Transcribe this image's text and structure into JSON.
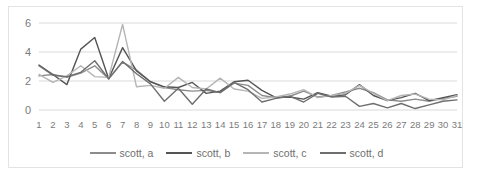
{
  "chart_data": {
    "type": "line",
    "title": "",
    "xlabel": "",
    "ylabel": "",
    "xlim": [
      1,
      31
    ],
    "ylim": [
      0,
      6
    ],
    "yticks": [
      0,
      2,
      4,
      6
    ],
    "grid": true,
    "legend_position": "bottom",
    "categories": [
      1,
      2,
      3,
      4,
      5,
      6,
      7,
      8,
      9,
      10,
      11,
      12,
      13,
      14,
      15,
      16,
      17,
      18,
      19,
      20,
      21,
      22,
      23,
      24,
      25,
      26,
      27,
      28,
      29,
      30,
      31
    ],
    "series": [
      {
        "name": "scott, a",
        "color": "#8c8c8c",
        "values": [
          2.35,
          2.45,
          2.25,
          2.55,
          3.05,
          2.15,
          3.3,
          2.75,
          1.95,
          1.55,
          1.4,
          1.3,
          1.35,
          1.2,
          1.85,
          1.7,
          1.0,
          0.85,
          0.95,
          1.3,
          0.9,
          1.0,
          1.25,
          1.5,
          1.2,
          0.7,
          0.6,
          0.75,
          0.6,
          0.8,
          0.95
        ]
      },
      {
        "name": "scott, b",
        "color": "#555555",
        "values": [
          3.1,
          2.45,
          1.75,
          4.2,
          5.0,
          2.15,
          4.3,
          2.7,
          1.95,
          1.6,
          1.55,
          1.9,
          1.15,
          1.3,
          1.95,
          2.05,
          1.35,
          0.85,
          0.9,
          0.75,
          1.2,
          0.95,
          1.05,
          1.75,
          1.0,
          0.65,
          0.85,
          1.15,
          0.65,
          0.85,
          1.05
        ]
      },
      {
        "name": "scott, c",
        "color": "#b5b5b5",
        "values": [
          2.45,
          1.9,
          2.35,
          3.05,
          2.3,
          2.25,
          5.9,
          1.6,
          1.7,
          1.5,
          2.25,
          1.55,
          1.45,
          2.2,
          1.45,
          1.3,
          0.8,
          0.9,
          1.1,
          1.4,
          0.85,
          1.0,
          1.15,
          1.7,
          1.15,
          0.65,
          1.0,
          1.1,
          0.75,
          0.7,
          1.0
        ]
      },
      {
        "name": "scott, d",
        "color": "#6e6e6e",
        "values": [
          3.05,
          2.4,
          2.3,
          2.6,
          3.4,
          2.15,
          3.35,
          2.5,
          1.8,
          0.6,
          1.5,
          0.4,
          1.45,
          1.2,
          1.9,
          1.4,
          0.55,
          0.8,
          0.95,
          0.55,
          1.15,
          0.9,
          0.95,
          0.25,
          0.45,
          0.15,
          0.45,
          0.1,
          0.35,
          0.6,
          0.7
        ]
      }
    ]
  },
  "legend": {
    "items": [
      {
        "label": "scott, a"
      },
      {
        "label": "scott, b"
      },
      {
        "label": "scott, c"
      },
      {
        "label": "scott, d"
      }
    ]
  },
  "axis": {
    "gridline_color": "#d9d9d9",
    "tick_label_color": "#7b7b7b"
  }
}
